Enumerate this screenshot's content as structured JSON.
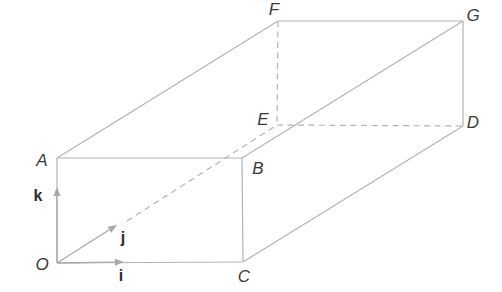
{
  "figure": {
    "colors": {
      "edge_line": "#b3b3b3",
      "arrow_fill": "#a8a8a8",
      "label_text": "#3a3a3a"
    },
    "vertices": {
      "O": {
        "x": 57,
        "y": 263
      },
      "A": {
        "x": 57,
        "y": 158
      },
      "B": {
        "x": 242,
        "y": 158
      },
      "C": {
        "x": 243,
        "y": 262
      },
      "D": {
        "x": 463,
        "y": 126
      },
      "E": {
        "x": 277,
        "y": 125
      },
      "F": {
        "x": 278,
        "y": 21
      },
      "G": {
        "x": 463,
        "y": 21
      }
    },
    "edges": [
      {
        "from": "O",
        "to": "A",
        "style": "solid"
      },
      {
        "from": "A",
        "to": "B",
        "style": "solid"
      },
      {
        "from": "B",
        "to": "C",
        "style": "solid"
      },
      {
        "from": "O",
        "to": "C",
        "style": "solid"
      },
      {
        "from": "A",
        "to": "F",
        "style": "solid"
      },
      {
        "from": "F",
        "to": "G",
        "style": "solid"
      },
      {
        "from": "B",
        "to": "G",
        "style": "solid"
      },
      {
        "from": "G",
        "to": "D",
        "style": "solid"
      },
      {
        "from": "C",
        "to": "D",
        "style": "solid"
      },
      {
        "from": "F",
        "to": "E",
        "style": "dashed"
      },
      {
        "from": "E",
        "to": "D",
        "style": "dashed"
      },
      {
        "name": "O-E",
        "style": "dashed",
        "points": [
          [
            127,
            221
          ],
          [
            277,
            125
          ]
        ]
      }
    ],
    "vectors": [
      {
        "name": "k",
        "from": "O",
        "to": [
          57,
          187
        ]
      },
      {
        "name": "j",
        "from": "O",
        "to": [
          117,
          225
        ]
      },
      {
        "name": "i",
        "from": "O",
        "to": [
          124,
          262
        ]
      }
    ],
    "labels": {
      "O": {
        "text": "O",
        "x": 42,
        "y": 264
      },
      "A": {
        "text": "A",
        "x": 42,
        "y": 160
      },
      "B": {
        "text": "B",
        "x": 258,
        "y": 168
      },
      "C": {
        "text": "C",
        "x": 244,
        "y": 276
      },
      "D": {
        "text": "D",
        "x": 473,
        "y": 122
      },
      "E": {
        "text": "E",
        "x": 263,
        "y": 119
      },
      "F": {
        "text": "F",
        "x": 274,
        "y": 9
      },
      "G": {
        "text": "G",
        "x": 473,
        "y": 15
      },
      "k": {
        "text": "k",
        "x": 38,
        "y": 196
      },
      "j": {
        "text": "j",
        "x": 123,
        "y": 238
      },
      "i": {
        "text": "i",
        "x": 121,
        "y": 276
      }
    }
  }
}
